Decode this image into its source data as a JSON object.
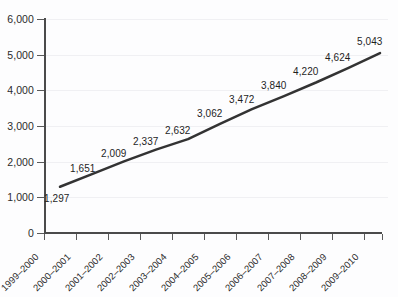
{
  "chart_data": {
    "type": "line",
    "title": "",
    "subtitle": "",
    "xlabel": "",
    "ylabel": "",
    "categories": [
      "1999–2000",
      "2000–2001",
      "2001–2002",
      "2002–2003",
      "2003–2004",
      "2004–2005",
      "2005–2006",
      "2006–2007",
      "2007–2008",
      "2008–2009",
      "2009–2010"
    ],
    "values": [
      1297,
      1651,
      2009,
      2337,
      2632,
      3062,
      3472,
      3840,
      4220,
      4624,
      5043
    ],
    "data_labels": [
      "1,297",
      "1,651",
      "2,009",
      "2,337",
      "2,632",
      "3,062",
      "3,472",
      "3,840",
      "4,220",
      "4,624",
      "5,043"
    ],
    "ylim": [
      0,
      6000
    ],
    "ytick_values": [
      0,
      1000,
      2000,
      3000,
      4000,
      5000,
      6000
    ],
    "ytick_labels": [
      "0",
      "1,000",
      "2,000",
      "3,000",
      "4,000",
      "5,000",
      "6,000"
    ],
    "grid": true,
    "grid_axis": "y",
    "legend": false,
    "legend_position": "none",
    "series": [
      {
        "name": "",
        "values": [
          1297,
          1651,
          2009,
          2337,
          2632,
          3062,
          3472,
          3840,
          4220,
          4624,
          5043
        ],
        "color": "#333333",
        "line_width": 2.5,
        "markers": false
      }
    ],
    "annotations": []
  },
  "colors": {
    "series_line": "#333333",
    "axis": "#4b4b4b",
    "grid": "#f0f0f3",
    "text": "#1f1f1f",
    "background": "#fdfdfe"
  }
}
